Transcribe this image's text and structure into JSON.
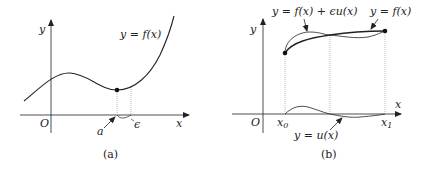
{
  "panel_a": {
    "caption": "(a)",
    "y_axis_label": "y",
    "x_axis_label": "x",
    "origin_label": "O",
    "curve_label": "y = f(x)",
    "point_label": "a",
    "epsilon_label": "ϵ"
  },
  "panel_b": {
    "caption": "(b)",
    "y_axis_label": "y",
    "x_axis_label": "x",
    "origin_label": "O",
    "x0_label": "x",
    "x0_sub": "0",
    "x1_label": "x",
    "x1_sub": "1",
    "perturbed_curve_label": "y = f(x) + ϵu(x)",
    "curve_label": "y = f(x)",
    "variation_label": "y = u(x)"
  },
  "colors": {
    "ink": "#222222",
    "guide": "#b0b0b0",
    "background": "#ffffff"
  }
}
